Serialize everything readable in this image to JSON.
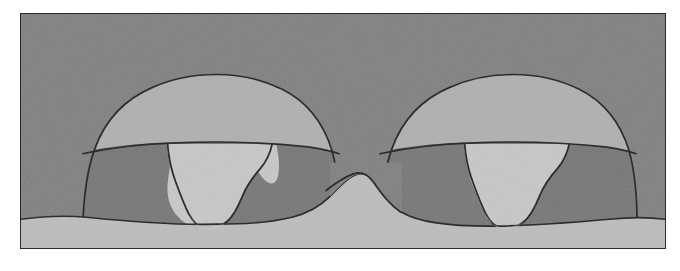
{
  "figure": {
    "kind": "grayscale-cross-section-micrograph",
    "caption": "",
    "frame": {
      "x": 20,
      "y": 13,
      "width": 646,
      "height": 236,
      "border_color": "#2a2a2a",
      "page_background": "#ffffff"
    },
    "palette": {
      "background_medium_gray": "#7f7f7f",
      "cap_layer_light_gray": "#b0b0b0",
      "mid_layer_dark_gray": "#757575",
      "funnel_bright_gray": "#c8c8c8",
      "substrate_light_gray": "#bdbdbd",
      "outline_black": "#1e1e1e"
    },
    "layers": [
      {
        "name": "background",
        "label": "background matrix",
        "tone": "#7f7f7f"
      },
      {
        "name": "substrate",
        "label": "lower substrate layer",
        "tone": "#bdbdbd"
      },
      {
        "name": "cap",
        "label": "upper mound cap layer",
        "tone": "#b0b0b0"
      },
      {
        "name": "mid",
        "label": "intermediate shoulder layer",
        "tone": "#757575"
      },
      {
        "name": "funnel",
        "label": "central bright funnel / fill",
        "tone": "#c8c8c8"
      }
    ],
    "features": [
      {
        "name": "left-mound",
        "label": "left mound structure",
        "center_x": 195
      },
      {
        "name": "right-mound",
        "label": "right mound structure",
        "center_x": 492
      },
      {
        "name": "center-trench",
        "label": "central V trench",
        "center_x": 345
      },
      {
        "name": "left-funnel",
        "label": "left bright funnel",
        "center_x": 195
      },
      {
        "name": "right-funnel",
        "label": "right bright funnel",
        "center_x": 492
      }
    ],
    "geometry": {
      "substrate_profile": "M0,236 L0,206 C40,203 70,204 92,207 C140,214 190,216 236,214 C268,212 292,205 310,190 C322,180 330,172 338,168 C344,165 350,166 356,172 C366,182 376,194 392,203 C412,213 452,217 500,215 C548,213 586,208 620,206 C634,205 642,205 646,206 L646,236 Z",
      "left_cap_outline": "M62,210 C63,182 66,158 74,136 C84,108 104,86 132,74 C152,65 176,61 196,61 C218,61 242,66 262,76 C288,89 304,112 312,138 C318,160 320,182 320,210",
      "left_mid_top": "M62,140 C90,134 120,130 158,129 C200,128 250,130 288,134 C300,135 310,137 318,139",
      "right_cap_outline": "M360,210 C361,182 364,158 372,136 C382,108 402,86 430,74 C450,65 474,61 494,61 C516,61 540,66 560,76 C586,89 602,112 610,138 C616,160 618,182 618,210",
      "right_mid_top": "M360,140 C388,134 418,130 456,129 C498,128 548,130 586,134 C598,135 608,137 616,139"
    }
  }
}
